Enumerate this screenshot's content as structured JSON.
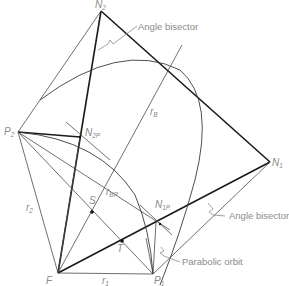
{
  "figure": {
    "points": {
      "N2": {
        "label": "N",
        "sub": "2",
        "x": 101,
        "y": 11
      },
      "N1": {
        "label": "N",
        "sub": "1",
        "x": 270,
        "y": 162
      },
      "P2": {
        "label": "P",
        "sub": "2",
        "x": 18,
        "y": 132
      },
      "P1": {
        "label": "P",
        "sub": "1",
        "x": 153,
        "y": 274
      },
      "F": {
        "label": "F",
        "x": 58,
        "y": 273
      },
      "N2P": {
        "label": "N",
        "sub": "2P",
        "x": 80,
        "y": 137
      },
      "N1P": {
        "label": "N",
        "sub": "1P",
        "x": 160,
        "y": 224
      },
      "S": {
        "label": "S",
        "x": 92,
        "y": 212
      },
      "T": {
        "label": "T",
        "x": 122,
        "y": 241
      }
    },
    "radius_labels": {
      "r1": {
        "label": "r",
        "sub": "1"
      },
      "r2": {
        "label": "r",
        "sub": "2"
      },
      "rB": {
        "label": "r",
        "sub": "B"
      },
      "rBP": {
        "label": "r",
        "sub": "BP"
      }
    },
    "annotations": {
      "angle_bisector_top": "Angle bisector",
      "angle_bisector_right": "Angle bisector",
      "parabolic_orbit": "Parabolic orbit"
    },
    "colors": {
      "line": "#1a1a1a",
      "thin_line": "#4a4a4a",
      "label": "#8a8a8a",
      "background": "#ffffff"
    }
  }
}
